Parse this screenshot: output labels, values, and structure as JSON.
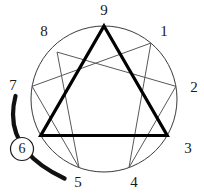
{
  "diagram": {
    "type": "enneagram-figure",
    "geometry": {
      "center_x": 104,
      "center_y": 99,
      "radius": 73,
      "point_angles_deg": {
        "9": -90,
        "1": -50,
        "2": -10,
        "3": 30,
        "4": 70,
        "5": 110,
        "6": 150,
        "7": 190,
        "8": 230
      }
    },
    "colors": {
      "outline": "#3a3a3a",
      "thin_line": "#585858",
      "bold_line": "#000000",
      "label_text": "#1a1a1a",
      "background": "#ffffff"
    },
    "points": [
      {
        "id": "point-9",
        "label": "9",
        "label_x": 104,
        "label_y": 12
      },
      {
        "id": "point-1",
        "label": "1",
        "label_x": 164,
        "label_y": 33
      },
      {
        "id": "point-2",
        "label": "2",
        "label_x": 194,
        "label_y": 89
      },
      {
        "id": "point-3",
        "label": "3",
        "label_x": 188,
        "label_y": 150
      },
      {
        "id": "point-4",
        "label": "4",
        "label_x": 134,
        "label_y": 184
      },
      {
        "id": "point-5",
        "label": "5",
        "label_x": 78,
        "label_y": 184
      },
      {
        "id": "point-6",
        "label": "6",
        "label_x": 22,
        "label_y": 149
      },
      {
        "id": "point-7",
        "label": "7",
        "label_x": 13,
        "label_y": 87
      },
      {
        "id": "point-8",
        "label": "8",
        "label_x": 44,
        "label_y": 33
      }
    ],
    "circled_point": "6",
    "bold_triangle_sequence": [
      "9",
      "3",
      "6",
      "9"
    ],
    "hexad_sequence": [
      "1",
      "4",
      "2",
      "8",
      "5",
      "7",
      "1"
    ],
    "arrow_arc": {
      "name": "arc-7-6-5",
      "from_point": "7",
      "through_point": "6",
      "to_point": "5",
      "stroke_width": 4
    }
  }
}
